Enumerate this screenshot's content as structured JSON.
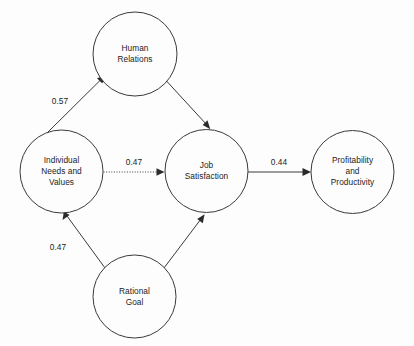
{
  "diagram": {
    "type": "path-model",
    "background_color": "#fdfdfd",
    "stroke_color": "#3a3a3a",
    "text_color": "#232323",
    "nodes": [
      {
        "id": "human-relations",
        "label": "Human\nRelations",
        "cx": 135,
        "cy": 54,
        "r": 42
      },
      {
        "id": "individual-needs-and-values",
        "label": "Individual\nNeeds and\nValues",
        "cx": 61.5,
        "cy": 171.5,
        "r": 41.5
      },
      {
        "id": "job-satisfaction",
        "label": "Job\nSatisfaction",
        "cx": 206.5,
        "cy": 171,
        "r": 41.5
      },
      {
        "id": "profitability-and-productivity",
        "label": "Profitability\nand\nProductivity",
        "cx": 352.5,
        "cy": 172,
        "r": 41.5
      },
      {
        "id": "rational-goal",
        "label": "Rational\nGoal",
        "cx": 134.5,
        "cy": 296.5,
        "r": 41.5
      }
    ],
    "edges": [
      {
        "id": "needs-to-human-relations",
        "from": "individual-needs-and-values",
        "to": "human-relations",
        "value": "0.57",
        "style": "solid",
        "label_x": 60,
        "label_y": 101
      },
      {
        "id": "human-relations-to-job-satisfaction",
        "from": "human-relations",
        "to": "job-satisfaction",
        "value": "",
        "style": "solid"
      },
      {
        "id": "needs-to-job-satisfaction",
        "from": "individual-needs-and-values",
        "to": "job-satisfaction",
        "value": "0.47",
        "style": "dotted",
        "label_x": 134,
        "label_y": 162
      },
      {
        "id": "job-satisfaction-to-profitability",
        "from": "job-satisfaction",
        "to": "profitability-and-productivity",
        "value": "0.44",
        "style": "solid",
        "label_x": 279,
        "label_y": 162
      },
      {
        "id": "rational-goal-to-needs",
        "from": "rational-goal",
        "to": "individual-needs-and-values",
        "value": "0.47",
        "style": "solid",
        "label_x": 58,
        "label_y": 247
      },
      {
        "id": "rational-goal-to-job-satisfaction",
        "from": "rational-goal",
        "to": "job-satisfaction",
        "value": "",
        "style": "solid"
      }
    ]
  }
}
